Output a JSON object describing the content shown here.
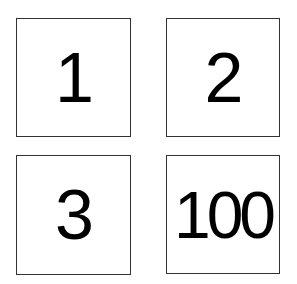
{
  "cards": [
    {
      "label": "1"
    },
    {
      "label": "2"
    },
    {
      "label": "3"
    },
    {
      "label": "100"
    }
  ]
}
